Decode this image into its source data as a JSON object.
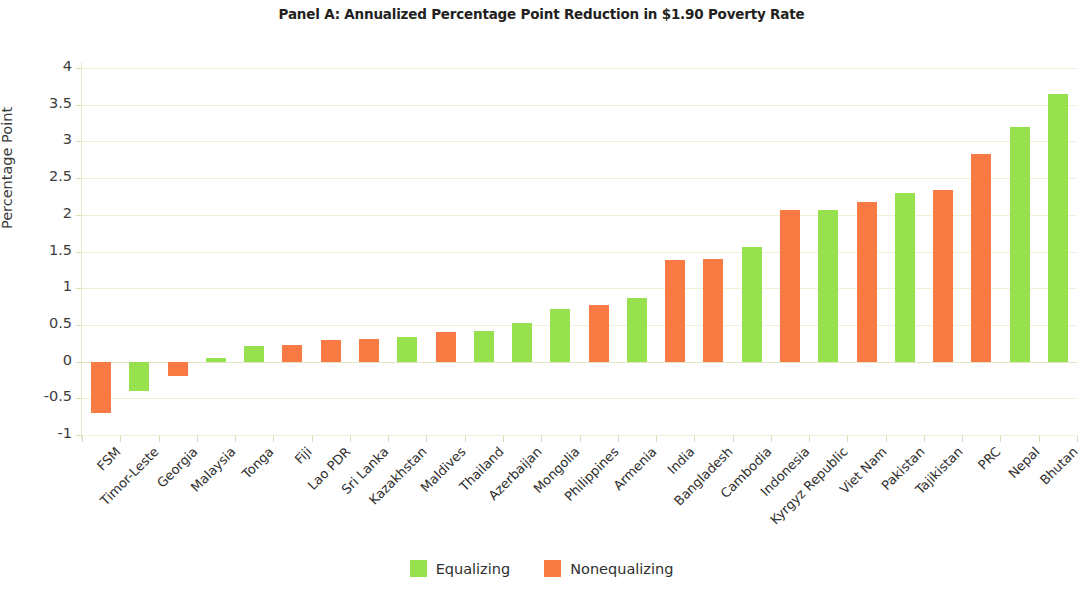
{
  "chart_data": {
    "type": "bar",
    "title": "Panel A: Annualized Percentage Point Reduction in $1.90 Poverty Rate",
    "xlabel": "",
    "ylabel": "Percentage Point",
    "ylim": [
      -1,
      4
    ],
    "ytick_labels": [
      "4",
      "3.5",
      "3",
      "2.5",
      "2",
      "1.5",
      "1",
      "0.5",
      "0",
      "-0.5",
      "-1"
    ],
    "ytick_values": [
      4,
      3.5,
      3,
      2.5,
      2,
      1.5,
      1,
      0.5,
      0,
      -0.5,
      -1
    ],
    "grid": true,
    "legend_position": "bottom",
    "categories": [
      "FSM",
      "Timor-Leste",
      "Georgia",
      "Malaysia",
      "Tonga",
      "Fiji",
      "Lao PDR",
      "Sri Lanka",
      "Kazakhstan",
      "Maldives",
      "Thailand",
      "Azerbaijan",
      "Mongolia",
      "Philippines",
      "Armenia",
      "India",
      "Bangladesh",
      "Cambodia",
      "Indonesia",
      "Kyrgyz Republic",
      "Viet Nam",
      "Pakistan",
      "Tajikistan",
      "PRC",
      "Nepal",
      "Bhutan"
    ],
    "values": [
      -0.7,
      -0.4,
      -0.2,
      0.05,
      0.21,
      0.23,
      0.3,
      0.31,
      0.33,
      0.4,
      0.42,
      0.53,
      0.72,
      0.77,
      0.87,
      1.39,
      1.4,
      1.56,
      2.06,
      2.07,
      2.18,
      2.3,
      2.34,
      2.83,
      3.2,
      3.65
    ],
    "groups": [
      "Nonequalizing",
      "Equalizing",
      "Nonequalizing",
      "Equalizing",
      "Equalizing",
      "Nonequalizing",
      "Nonequalizing",
      "Nonequalizing",
      "Equalizing",
      "Nonequalizing",
      "Equalizing",
      "Equalizing",
      "Equalizing",
      "Nonequalizing",
      "Equalizing",
      "Nonequalizing",
      "Nonequalizing",
      "Equalizing",
      "Nonequalizing",
      "Equalizing",
      "Nonequalizing",
      "Equalizing",
      "Nonequalizing",
      "Nonequalizing",
      "Equalizing",
      "Equalizing"
    ],
    "series": [
      {
        "name": "Equalizing",
        "color": "#97e14e",
        "points": [
          {
            "category": "Timor-Leste",
            "value": -0.4
          },
          {
            "category": "Malaysia",
            "value": 0.05
          },
          {
            "category": "Tonga",
            "value": 0.21
          },
          {
            "category": "Kazakhstan",
            "value": 0.33
          },
          {
            "category": "Thailand",
            "value": 0.42
          },
          {
            "category": "Azerbaijan",
            "value": 0.53
          },
          {
            "category": "Mongolia",
            "value": 0.72
          },
          {
            "category": "Armenia",
            "value": 0.87
          },
          {
            "category": "Cambodia",
            "value": 1.56
          },
          {
            "category": "Kyrgyz Republic",
            "value": 2.07
          },
          {
            "category": "Pakistan",
            "value": 2.3
          },
          {
            "category": "Nepal",
            "value": 3.2
          },
          {
            "category": "Bhutan",
            "value": 3.65
          }
        ]
      },
      {
        "name": "Nonequalizing",
        "color": "#f97a42",
        "points": [
          {
            "category": "FSM",
            "value": -0.7
          },
          {
            "category": "Georgia",
            "value": -0.2
          },
          {
            "category": "Fiji",
            "value": 0.23
          },
          {
            "category": "Lao PDR",
            "value": 0.3
          },
          {
            "category": "Sri Lanka",
            "value": 0.31
          },
          {
            "category": "Maldives",
            "value": 0.4
          },
          {
            "category": "Philippines",
            "value": 0.77
          },
          {
            "category": "India",
            "value": 1.39
          },
          {
            "category": "Bangladesh",
            "value": 1.4
          },
          {
            "category": "Indonesia",
            "value": 2.06
          },
          {
            "category": "Viet Nam",
            "value": 2.18
          },
          {
            "category": "Tajikistan",
            "value": 2.34
          },
          {
            "category": "PRC",
            "value": 2.83
          }
        ]
      }
    ]
  },
  "legend": {
    "items": [
      {
        "label": "Equalizing",
        "color": "#97e14e"
      },
      {
        "label": "Nonequalizing",
        "color": "#f97a42"
      }
    ]
  },
  "colors": {
    "equalizing": "#97e14e",
    "nonequalizing": "#f97a42",
    "grid": "#eff0d8",
    "text": "#2f2f2f"
  }
}
